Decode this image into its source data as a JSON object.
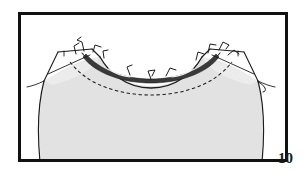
{
  "figure": {
    "number_label": "10",
    "caption": "",
    "frame": {
      "border_color": "#111111",
      "background_color": "#ffffff",
      "x": 18,
      "y": 12,
      "width": 270,
      "height": 150,
      "border_width": 3
    },
    "illustration": {
      "subject": "garment-neckline-with-pinned-binding",
      "style": "line-drawing",
      "fabric_fill_color": "#e2e2e2",
      "fabric_edge_color": "#2b2b2b",
      "outline_color": "#1c1c1c",
      "stitch_line_color": "#1c1c1c",
      "binding_strip_color": "#333333",
      "parts": [
        {
          "name": "bodice-front-body",
          "label": "bodice front"
        },
        {
          "name": "neckline-opening",
          "label": "neckline opening"
        },
        {
          "name": "neckline-binding-strip",
          "label": "binding strip"
        },
        {
          "name": "basting-stitch-line",
          "label": "stitching line"
        },
        {
          "name": "left-shoulder-seam",
          "label": "left shoulder"
        },
        {
          "name": "right-shoulder-seam",
          "label": "right shoulder"
        },
        {
          "name": "left-armhole-edge",
          "label": "left armhole"
        },
        {
          "name": "right-armhole-edge",
          "label": "right armhole"
        },
        {
          "name": "straight-pins",
          "label": "pins",
          "count": 10
        }
      ]
    }
  }
}
